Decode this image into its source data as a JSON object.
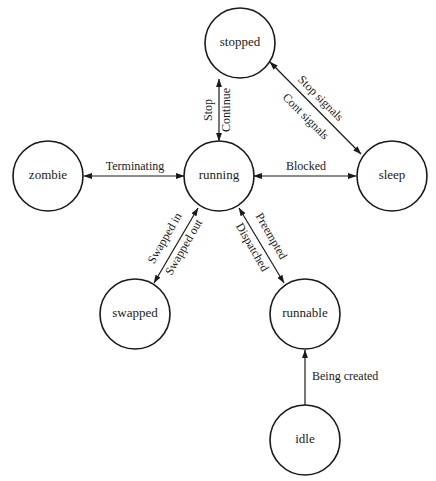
{
  "diagram": {
    "type": "state-transition",
    "nodes": [
      {
        "id": "stopped",
        "label": "stopped",
        "cx": 240,
        "cy": 43,
        "r": 35
      },
      {
        "id": "zombie",
        "label": "zombie",
        "cx": 48,
        "cy": 176,
        "r": 35
      },
      {
        "id": "running",
        "label": "running",
        "cx": 219,
        "cy": 176,
        "r": 35
      },
      {
        "id": "sleep",
        "label": "sleep",
        "cx": 392,
        "cy": 176,
        "r": 35
      },
      {
        "id": "swapped",
        "label": "swapped",
        "cx": 135,
        "cy": 314,
        "r": 35
      },
      {
        "id": "runnable",
        "label": "runnable",
        "cx": 305,
        "cy": 314,
        "r": 35
      },
      {
        "id": "idle",
        "label": "idle",
        "cx": 305,
        "cy": 440,
        "r": 35
      }
    ],
    "edges": [
      {
        "from": "running",
        "to": "stopped",
        "bidirectional": true,
        "labels": [
          "Stop",
          "Continue"
        ]
      },
      {
        "from": "stopped",
        "to": "sleep",
        "bidirectional": true,
        "labels": [
          "Stop signals",
          "Cont signals"
        ]
      },
      {
        "from": "running",
        "to": "zombie",
        "bidirectional": true,
        "labels": [
          "Terminating"
        ]
      },
      {
        "from": "running",
        "to": "sleep",
        "bidirectional": true,
        "labels": [
          "Blocked"
        ]
      },
      {
        "from": "running",
        "to": "swapped",
        "bidirectional": true,
        "labels": [
          "Swapped in",
          "Swapped out"
        ]
      },
      {
        "from": "running",
        "to": "runnable",
        "bidirectional": true,
        "labels": [
          "Preempted",
          "Dispatched"
        ]
      },
      {
        "from": "idle",
        "to": "runnable",
        "bidirectional": false,
        "labels": [
          "Being created"
        ]
      }
    ]
  },
  "labels": {
    "stop": "Stop",
    "continue": "Continue",
    "stop_signals": "Stop signals",
    "cont_signals": "Cont signals",
    "terminating": "Terminating",
    "blocked": "Blocked",
    "swapped_in": "Swapped in",
    "swapped_out": "Swapped out",
    "preempted": "Preempted",
    "dispatched": "Dispatched",
    "being_created": "Being created"
  },
  "nodes_text": {
    "stopped": "stopped",
    "zombie": "zombie",
    "running": "running",
    "sleep": "sleep",
    "swapped": "swapped",
    "runnable": "runnable",
    "idle": "idle"
  }
}
